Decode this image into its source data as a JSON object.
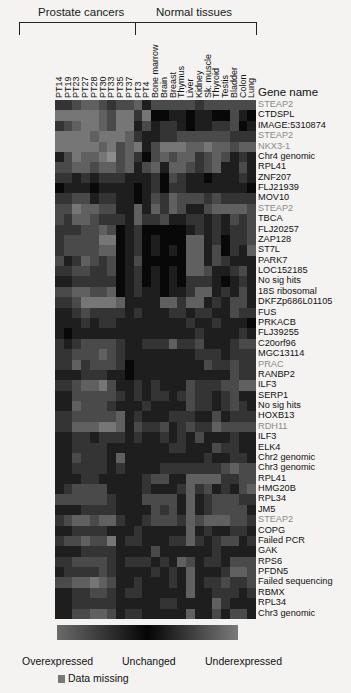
{
  "chart_data": {
    "type": "heatmap",
    "title": "",
    "groups": [
      {
        "label": "Prostate cancers",
        "columns": [
          "PT14",
          "PT19",
          "PT23",
          "PT27",
          "PT28",
          "PT30",
          "PT33",
          "PT35",
          "PT37",
          "PT3",
          "PT4"
        ]
      },
      {
        "label": "Normal tissues",
        "columns": [
          "Bone marrow",
          "Brain",
          "Breast",
          "Thymus",
          "Liver",
          "Kidney",
          "Sk. muscle",
          "Thyroid",
          "Testis",
          "Bladder",
          "Colon",
          "Lung"
        ]
      }
    ],
    "columns": [
      "PT14",
      "PT19",
      "PT23",
      "PT27",
      "PT28",
      "PT30",
      "PT33",
      "PT35",
      "PT37",
      "PT3",
      "PT4",
      "Bone marrow",
      "Brain",
      "Breast",
      "Thymus",
      "Liver",
      "Kidney",
      "Sk. muscle",
      "Thyroid",
      "Testis",
      "Bladder",
      "Colon",
      "Lung"
    ],
    "row_header": "Gene name",
    "rows": [
      {
        "gene": "STEAP2",
        "gray": true
      },
      {
        "gene": "CTDSPL"
      },
      {
        "gene": "IMAGE:5310874"
      },
      {
        "gene": "STEAP2",
        "gray": true
      },
      {
        "gene": "NKX3-1",
        "gray": true
      },
      {
        "gene": "Chr4 genomic"
      },
      {
        "gene": "RPL41"
      },
      {
        "gene": "ZNF207"
      },
      {
        "gene": "FLJ21939"
      },
      {
        "gene": "MOV10"
      },
      {
        "gene": "STEAP2",
        "gray": true
      },
      {
        "gene": "TBCA"
      },
      {
        "gene": "FLJ20257"
      },
      {
        "gene": "ZAP128"
      },
      {
        "gene": "ST7L"
      },
      {
        "gene": "PARK7"
      },
      {
        "gene": "LOC152185"
      },
      {
        "gene": "No sig hits"
      },
      {
        "gene": "18S ribosomal"
      },
      {
        "gene": "DKFZp686L01105"
      },
      {
        "gene": "FUS"
      },
      {
        "gene": "PRKACB"
      },
      {
        "gene": "FLJ39255"
      },
      {
        "gene": "C20orf96"
      },
      {
        "gene": "MGC13114"
      },
      {
        "gene": "PRAC",
        "gray": true
      },
      {
        "gene": "RANBP2"
      },
      {
        "gene": "ILF3"
      },
      {
        "gene": "SERP1"
      },
      {
        "gene": "No sig hits"
      },
      {
        "gene": "HOXB13"
      },
      {
        "gene": "RDH11",
        "gray": true
      },
      {
        "gene": "ILF3"
      },
      {
        "gene": "ELK4"
      },
      {
        "gene": "Chr2 genomic"
      },
      {
        "gene": "Chr3 genomic"
      },
      {
        "gene": "RPL41"
      },
      {
        "gene": "HMG20B"
      },
      {
        "gene": "RPL34"
      },
      {
        "gene": "JM5"
      },
      {
        "gene": "STEAP2",
        "gray": true
      },
      {
        "gene": "COPG"
      },
      {
        "gene": "Failed PCR"
      },
      {
        "gene": "GAK"
      },
      {
        "gene": "RPS6"
      },
      {
        "gene": "PFDN5"
      },
      {
        "gene": "Failed sequencing"
      },
      {
        "gene": "RBMX"
      },
      {
        "gene": "RPL34"
      },
      {
        "gene": "Chr3 genomic"
      }
    ],
    "shade_note": "values 0-9: 0=black (unchanged), higher=brighter gray (over/under-expressed); approximate",
    "values": [
      [
        2,
        2,
        3,
        4,
        4,
        3,
        2,
        3,
        3,
        4,
        1,
        3,
        3,
        3,
        3,
        3,
        2,
        3,
        3,
        3,
        3,
        3,
        3
      ],
      [
        5,
        5,
        5,
        5,
        5,
        4,
        3,
        5,
        5,
        2,
        5,
        0,
        0,
        1,
        1,
        0,
        1,
        1,
        0,
        0,
        3,
        1,
        0
      ],
      [
        2,
        3,
        4,
        5,
        5,
        4,
        3,
        5,
        5,
        1,
        3,
        1,
        2,
        2,
        1,
        0,
        1,
        1,
        2,
        2,
        3,
        0,
        1
      ],
      [
        5,
        5,
        5,
        5,
        4,
        5,
        5,
        5,
        4,
        2,
        1,
        1,
        2,
        2,
        3,
        3,
        3,
        3,
        3,
        3,
        2,
        2,
        2
      ],
      [
        5,
        5,
        5,
        5,
        5,
        4,
        5,
        3,
        4,
        5,
        1,
        3,
        5,
        5,
        5,
        4,
        4,
        5,
        4,
        4,
        3,
        4,
        4
      ],
      [
        1,
        3,
        5,
        4,
        4,
        5,
        6,
        3,
        4,
        2,
        0,
        3,
        4,
        3,
        4,
        4,
        2,
        3,
        4,
        3,
        1,
        2,
        1
      ],
      [
        3,
        3,
        4,
        4,
        3,
        4,
        4,
        3,
        4,
        1,
        3,
        4,
        1,
        4,
        4,
        3,
        2,
        3,
        4,
        1,
        1,
        3,
        1
      ],
      [
        2,
        2,
        1,
        2,
        1,
        2,
        2,
        2,
        1,
        1,
        1,
        2,
        0,
        3,
        2,
        1,
        1,
        0,
        1,
        1,
        1,
        2,
        1
      ],
      [
        0,
        1,
        1,
        1,
        0,
        1,
        1,
        1,
        1,
        0,
        1,
        2,
        0,
        2,
        2,
        1,
        1,
        1,
        1,
        1,
        1,
        1,
        0
      ],
      [
        2,
        2,
        3,
        3,
        1,
        2,
        2,
        1,
        1,
        0,
        1,
        3,
        2,
        4,
        3,
        3,
        3,
        2,
        3,
        2,
        2,
        2,
        2
      ],
      [
        3,
        3,
        5,
        4,
        4,
        3,
        3,
        1,
        1,
        4,
        1,
        4,
        2,
        4,
        3,
        1,
        1,
        3,
        4,
        4,
        4,
        4,
        3
      ],
      [
        3,
        2,
        4,
        4,
        3,
        2,
        2,
        2,
        1,
        4,
        2,
        2,
        3,
        1,
        1,
        2,
        2,
        1,
        2,
        1,
        3,
        2,
        3
      ],
      [
        2,
        2,
        2,
        3,
        3,
        4,
        3,
        0,
        1,
        2,
        0,
        0,
        0,
        0,
        0,
        1,
        2,
        1,
        2,
        1,
        2,
        2,
        3
      ],
      [
        2,
        3,
        3,
        3,
        3,
        5,
        5,
        0,
        1,
        2,
        0,
        1,
        0,
        0,
        0,
        4,
        4,
        1,
        2,
        0,
        2,
        2,
        3
      ],
      [
        2,
        3,
        3,
        3,
        3,
        4,
        4,
        0,
        1,
        2,
        0,
        1,
        0,
        1,
        0,
        4,
        4,
        1,
        3,
        0,
        2,
        1,
        4
      ],
      [
        3,
        1,
        2,
        4,
        3,
        2,
        3,
        0,
        1,
        3,
        0,
        0,
        0,
        0,
        0,
        4,
        4,
        1,
        3,
        2,
        1,
        1,
        1
      ],
      [
        2,
        2,
        3,
        3,
        2,
        2,
        3,
        0,
        1,
        2,
        0,
        1,
        0,
        1,
        0,
        4,
        4,
        3,
        1,
        1,
        2,
        3,
        1
      ],
      [
        1,
        1,
        2,
        2,
        2,
        2,
        2,
        0,
        1,
        2,
        0,
        1,
        0,
        1,
        0,
        2,
        2,
        2,
        1,
        0,
        1,
        2,
        1
      ],
      [
        3,
        3,
        4,
        4,
        3,
        3,
        4,
        0,
        1,
        2,
        1,
        1,
        0,
        1,
        1,
        2,
        4,
        4,
        1,
        2,
        1,
        3,
        1
      ],
      [
        2,
        2,
        3,
        5,
        5,
        5,
        5,
        4,
        1,
        1,
        1,
        1,
        4,
        4,
        2,
        4,
        4,
        1,
        2,
        1,
        3,
        3,
        1
      ],
      [
        1,
        1,
        2,
        3,
        2,
        2,
        2,
        2,
        1,
        2,
        1,
        1,
        1,
        2,
        2,
        1,
        2,
        2,
        1,
        1,
        3,
        2,
        2
      ],
      [
        1,
        1,
        1,
        2,
        1,
        2,
        2,
        1,
        1,
        1,
        1,
        1,
        1,
        1,
        1,
        2,
        1,
        1,
        2,
        1,
        1,
        1,
        0
      ],
      [
        1,
        0,
        1,
        1,
        1,
        1,
        1,
        1,
        1,
        1,
        1,
        1,
        1,
        1,
        1,
        1,
        2,
        1,
        1,
        1,
        1,
        2,
        1
      ],
      [
        2,
        1,
        2,
        3,
        3,
        3,
        3,
        2,
        1,
        1,
        2,
        2,
        2,
        4,
        2,
        2,
        3,
        1,
        1,
        1,
        2,
        3,
        3
      ],
      [
        2,
        2,
        3,
        3,
        3,
        4,
        3,
        2,
        1,
        1,
        1,
        1,
        1,
        1,
        1,
        1,
        2,
        2,
        2,
        1,
        2,
        2,
        2
      ],
      [
        2,
        2,
        4,
        2,
        3,
        3,
        3,
        2,
        0,
        1,
        1,
        1,
        1,
        1,
        1,
        1,
        1,
        3,
        2,
        2,
        3,
        2,
        2
      ],
      [
        1,
        1,
        1,
        2,
        2,
        2,
        1,
        1,
        0,
        1,
        1,
        1,
        1,
        1,
        1,
        1,
        1,
        1,
        1,
        1,
        3,
        2,
        2
      ],
      [
        2,
        2,
        3,
        4,
        4,
        5,
        3,
        1,
        1,
        2,
        1,
        2,
        1,
        1,
        1,
        3,
        2,
        2,
        2,
        3,
        3,
        4,
        4
      ],
      [
        1,
        1,
        3,
        3,
        3,
        3,
        3,
        2,
        1,
        2,
        1,
        2,
        2,
        1,
        2,
        3,
        2,
        2,
        1,
        2,
        3,
        1,
        1
      ],
      [
        1,
        1,
        4,
        3,
        3,
        3,
        2,
        1,
        1,
        1,
        2,
        1,
        1,
        1,
        1,
        3,
        2,
        2,
        1,
        2,
        3,
        2,
        1
      ],
      [
        2,
        2,
        3,
        3,
        3,
        3,
        3,
        4,
        1,
        2,
        1,
        1,
        1,
        2,
        2,
        2,
        1,
        1,
        3,
        1,
        2,
        2,
        2
      ],
      [
        2,
        2,
        4,
        4,
        4,
        5,
        5,
        4,
        1,
        3,
        2,
        2,
        3,
        1,
        2,
        3,
        2,
        2,
        4,
        3,
        3,
        3,
        3
      ],
      [
        1,
        1,
        2,
        2,
        1,
        2,
        2,
        2,
        1,
        2,
        1,
        1,
        2,
        1,
        2,
        1,
        3,
        1,
        1,
        1,
        2,
        1,
        1
      ],
      [
        1,
        1,
        2,
        2,
        2,
        2,
        1,
        1,
        1,
        1,
        1,
        1,
        1,
        2,
        2,
        1,
        1,
        1,
        3,
        2,
        2,
        1,
        1
      ],
      [
        1,
        1,
        3,
        2,
        2,
        2,
        1,
        4,
        1,
        1,
        1,
        1,
        1,
        1,
        1,
        1,
        1,
        2,
        1,
        1,
        2,
        2,
        1
      ],
      [
        1,
        1,
        2,
        2,
        2,
        2,
        1,
        2,
        1,
        1,
        1,
        1,
        2,
        2,
        2,
        2,
        2,
        2,
        2,
        3,
        4,
        3,
        3
      ],
      [
        1,
        1,
        1,
        2,
        2,
        1,
        1,
        1,
        1,
        1,
        2,
        3,
        3,
        1,
        1,
        4,
        4,
        4,
        4,
        2,
        2,
        3,
        3
      ],
      [
        1,
        2,
        3,
        3,
        3,
        3,
        1,
        1,
        1,
        1,
        2,
        1,
        1,
        1,
        2,
        4,
        2,
        3,
        1,
        2,
        1,
        3,
        4
      ],
      [
        3,
        3,
        3,
        3,
        3,
        3,
        2,
        1,
        1,
        1,
        3,
        3,
        3,
        3,
        1,
        4,
        1,
        2,
        3,
        3,
        3,
        2,
        2
      ],
      [
        1,
        1,
        1,
        2,
        2,
        2,
        2,
        1,
        1,
        1,
        1,
        3,
        2,
        3,
        1,
        4,
        1,
        2,
        3,
        3,
        3,
        3,
        1
      ],
      [
        2,
        3,
        4,
        4,
        3,
        4,
        4,
        2,
        1,
        1,
        2,
        3,
        3,
        3,
        2,
        4,
        3,
        4,
        4,
        4,
        3,
        3,
        2
      ],
      [
        1,
        1,
        2,
        2,
        2,
        2,
        1,
        1,
        1,
        2,
        1,
        1,
        1,
        1,
        1,
        4,
        1,
        2,
        1,
        1,
        2,
        2,
        1
      ],
      [
        2,
        3,
        3,
        4,
        3,
        3,
        5,
        1,
        2,
        2,
        1,
        1,
        1,
        2,
        2,
        4,
        2,
        1,
        2,
        3,
        3,
        1,
        2
      ],
      [
        1,
        1,
        1,
        2,
        2,
        2,
        2,
        1,
        1,
        1,
        1,
        3,
        1,
        1,
        1,
        1,
        1,
        1,
        2,
        1,
        1,
        1,
        1
      ],
      [
        2,
        2,
        3,
        3,
        3,
        3,
        2,
        1,
        2,
        2,
        2,
        1,
        2,
        1,
        4,
        3,
        1,
        2,
        2,
        1,
        3,
        3,
        3
      ],
      [
        1,
        2,
        2,
        2,
        2,
        3,
        2,
        1,
        1,
        1,
        1,
        2,
        1,
        2,
        1,
        4,
        1,
        1,
        1,
        2,
        4,
        4,
        3
      ],
      [
        3,
        3,
        4,
        4,
        5,
        4,
        3,
        1,
        1,
        2,
        1,
        1,
        1,
        2,
        1,
        4,
        1,
        2,
        2,
        3,
        2,
        2,
        3
      ],
      [
        1,
        1,
        2,
        2,
        3,
        3,
        2,
        1,
        2,
        2,
        1,
        1,
        1,
        1,
        1,
        4,
        1,
        1,
        2,
        2,
        2,
        1,
        2
      ],
      [
        1,
        1,
        2,
        2,
        2,
        2,
        2,
        1,
        1,
        1,
        1,
        1,
        2,
        2,
        1,
        1,
        1,
        1,
        4,
        2,
        1,
        1,
        1
      ],
      [
        1,
        1,
        3,
        3,
        4,
        4,
        3,
        1,
        2,
        2,
        1,
        1,
        1,
        1,
        1,
        4,
        1,
        1,
        3,
        1,
        3,
        3,
        1
      ]
    ],
    "legend": {
      "gradient": [
        "Overexpressed",
        "Unchanged",
        "Underexpressed"
      ],
      "missing": "Data missing",
      "missing_color": "#777777"
    }
  },
  "labels": {
    "group_prostate": "Prostate cancers",
    "group_normal": "Normal tissues",
    "gene_header": "Gene name",
    "scale_over": "Overexpressed",
    "scale_unchanged": "Unchanged",
    "scale_under": "Underexpressed",
    "missing": "Data missing"
  },
  "colors": {
    "background": "#f4f3f1",
    "text": "#111111",
    "gray_gene": "#8a8a8a",
    "gradient_left": "#6a6a6a",
    "gradient_mid": "#050505",
    "gradient_right": "#7a7a7a"
  }
}
